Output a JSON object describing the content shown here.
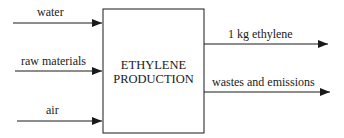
{
  "diagram": {
    "process": {
      "line1": "ETHYLENE",
      "line2": "PRODUCTION"
    },
    "inputs": [
      {
        "label": "water"
      },
      {
        "label": "raw materials"
      },
      {
        "label": "air"
      }
    ],
    "outputs": [
      {
        "label": "1 kg ethylene"
      },
      {
        "label": "wastes and emissions"
      }
    ],
    "colors": {
      "stroke": "#1a1a1a",
      "background": "#ffffff"
    }
  }
}
